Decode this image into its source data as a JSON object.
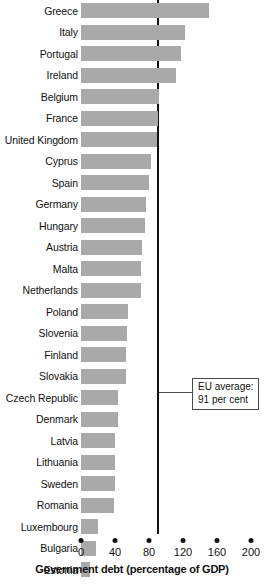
{
  "chart_data": {
    "type": "bar",
    "orientation": "horizontal",
    "title": "",
    "xlabel": "Government debt (percentage of GDP)",
    "ylabel": "",
    "xlim": [
      0,
      200
    ],
    "xticks": [
      0,
      40,
      80,
      120,
      160,
      200
    ],
    "xtick_labels": [
      "0",
      "40",
      "80",
      "120",
      "160",
      "200"
    ],
    "grid": false,
    "legend": "none",
    "bar_color": "#a9a9a9",
    "categories": [
      "Greece",
      "Italy",
      "Portugal",
      "Ireland",
      "Belgium",
      "France",
      "United Kingdom",
      "Cyprus",
      "Spain",
      "Germany",
      "Hungary",
      "Austria",
      "Malta",
      "Netherlands",
      "Poland",
      "Slovenia",
      "Finland",
      "Slovakia",
      "Czech Republic",
      "Denmark",
      "Latvia",
      "Lithuania",
      "Sweden",
      "Romania",
      "Luxembourg",
      "Bulgaria",
      "Estonia"
    ],
    "values": [
      150,
      122,
      118,
      112,
      92,
      90,
      89,
      82,
      80,
      77,
      75,
      72,
      70,
      70,
      55,
      54,
      53,
      53,
      44,
      44,
      40,
      40,
      40,
      39,
      20,
      18,
      10
    ],
    "annotations": [
      {
        "name": "eu-average-reference-line",
        "label_line1": "EU average:",
        "label_line2": "91 per cent",
        "value": 91
      }
    ]
  }
}
